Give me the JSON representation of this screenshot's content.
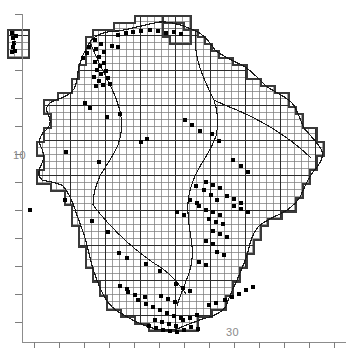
{
  "figure": {
    "type": "distribution-atlas-map",
    "title": "",
    "background_color": "#ffffff",
    "ink_color": "#111111",
    "axis_color": "#7d7d7d",
    "grid_color": "#5a5a5a",
    "marker_color": "#000000",
    "width": 348,
    "height": 357
  },
  "axes": {
    "y_axis": {
      "label_text": "10",
      "label_value": 10,
      "tick_count": 12,
      "tick_spacing_px": 28,
      "tick_first_y": 14,
      "tick_length_px": 7,
      "axis_x": 22,
      "axis_top": 14,
      "axis_bottom": 342,
      "labeled_tick_index": 5
    },
    "x_axis": {
      "label_text": "30",
      "label_value": 30,
      "tick_count": 13,
      "tick_spacing_px": 25,
      "tick_first_x": 34,
      "tick_length_px": 6,
      "axis_y": 342,
      "axis_left": 22,
      "axis_right": 346,
      "labeled_tick_index": 8
    }
  },
  "chart_data": {
    "type": "scatter",
    "title": "",
    "xlabel": "",
    "ylabel": "",
    "grid": true,
    "grid_cell_px": 7,
    "grid_major_every": 5,
    "legend": [],
    "annotations": [
      "10",
      "30"
    ],
    "region_outline_note": "county boundary with internal watercourse lines",
    "marker_shape": "filled-square",
    "marker_size_px": 4,
    "record_count": 132,
    "records": [
      [
        12,
        33
      ],
      [
        13,
        38
      ],
      [
        14,
        43
      ],
      [
        13,
        47
      ],
      [
        15,
        51
      ],
      [
        12,
        52
      ],
      [
        16,
        36
      ],
      [
        95,
        40
      ],
      [
        101,
        44
      ],
      [
        89,
        47
      ],
      [
        96,
        49
      ],
      [
        104,
        52
      ],
      [
        112,
        46
      ],
      [
        118,
        47
      ],
      [
        99,
        57
      ],
      [
        95,
        62
      ],
      [
        100,
        66
      ],
      [
        104,
        63
      ],
      [
        97,
        70
      ],
      [
        101,
        74
      ],
      [
        106,
        71
      ],
      [
        94,
        77
      ],
      [
        99,
        81
      ],
      [
        108,
        78
      ],
      [
        103,
        85
      ],
      [
        110,
        84
      ],
      [
        96,
        86
      ],
      [
        87,
        53
      ],
      [
        83,
        58
      ],
      [
        118,
        35
      ],
      [
        126,
        33
      ],
      [
        133,
        32
      ],
      [
        141,
        31
      ],
      [
        150,
        30
      ],
      [
        158,
        31
      ],
      [
        166,
        33
      ],
      [
        174,
        32
      ],
      [
        181,
        34
      ],
      [
        85,
        103
      ],
      [
        90,
        108
      ],
      [
        107,
        117
      ],
      [
        120,
        114
      ],
      [
        66,
        152
      ],
      [
        99,
        162
      ],
      [
        141,
        142
      ],
      [
        147,
        139
      ],
      [
        185,
        120
      ],
      [
        192,
        125
      ],
      [
        200,
        131
      ],
      [
        212,
        134
      ],
      [
        219,
        141
      ],
      [
        233,
        160
      ],
      [
        241,
        166
      ],
      [
        248,
        172
      ],
      [
        196,
        186
      ],
      [
        204,
        190
      ],
      [
        211,
        195
      ],
      [
        217,
        200
      ],
      [
        206,
        182
      ],
      [
        213,
        185
      ],
      [
        220,
        188
      ],
      [
        227,
        196
      ],
      [
        234,
        199
      ],
      [
        241,
        203
      ],
      [
        199,
        206
      ],
      [
        206,
        210
      ],
      [
        213,
        212
      ],
      [
        220,
        215
      ],
      [
        209,
        219
      ],
      [
        216,
        222
      ],
      [
        223,
        224
      ],
      [
        234,
        206
      ],
      [
        241,
        209
      ],
      [
        248,
        212
      ],
      [
        190,
        200
      ],
      [
        197,
        203
      ],
      [
        177,
        212
      ],
      [
        184,
        215
      ],
      [
        213,
        231
      ],
      [
        220,
        234
      ],
      [
        227,
        237
      ],
      [
        206,
        241
      ],
      [
        213,
        244
      ],
      [
        217,
        252
      ],
      [
        224,
        255
      ],
      [
        199,
        262
      ],
      [
        206,
        265
      ],
      [
        30,
        210
      ],
      [
        65,
        200
      ],
      [
        92,
        221
      ],
      [
        108,
        232
      ],
      [
        119,
        253
      ],
      [
        127,
        258
      ],
      [
        146,
        264
      ],
      [
        160,
        271
      ],
      [
        176,
        284
      ],
      [
        183,
        288
      ],
      [
        190,
        291
      ],
      [
        161,
        296
      ],
      [
        168,
        299
      ],
      [
        175,
        302
      ],
      [
        146,
        304
      ],
      [
        153,
        307
      ],
      [
        160,
        310
      ],
      [
        167,
        313
      ],
      [
        174,
        316
      ],
      [
        181,
        318
      ],
      [
        155,
        320
      ],
      [
        162,
        322
      ],
      [
        169,
        324
      ],
      [
        176,
        326
      ],
      [
        183,
        320
      ],
      [
        190,
        318
      ],
      [
        197,
        315
      ],
      [
        138,
        300
      ],
      [
        145,
        297
      ],
      [
        128,
        292
      ],
      [
        135,
        295
      ],
      [
        120,
        286
      ],
      [
        127,
        289
      ],
      [
        225,
        300
      ],
      [
        232,
        297
      ],
      [
        239,
        294
      ],
      [
        246,
        290
      ],
      [
        253,
        287
      ],
      [
        209,
        305
      ],
      [
        216,
        303
      ],
      [
        191,
        327
      ],
      [
        198,
        329
      ],
      [
        184,
        330
      ],
      [
        170,
        331
      ],
      [
        163,
        330
      ],
      [
        177,
        332
      ],
      [
        156,
        328
      ],
      [
        149,
        326
      ]
    ]
  },
  "map": {
    "name": "county-distribution-map",
    "grid_overlay_label": "10km-grid",
    "inset_island_label": "detached-grid-block-northwest",
    "detached_block_label": "detached-grid-block-north"
  }
}
